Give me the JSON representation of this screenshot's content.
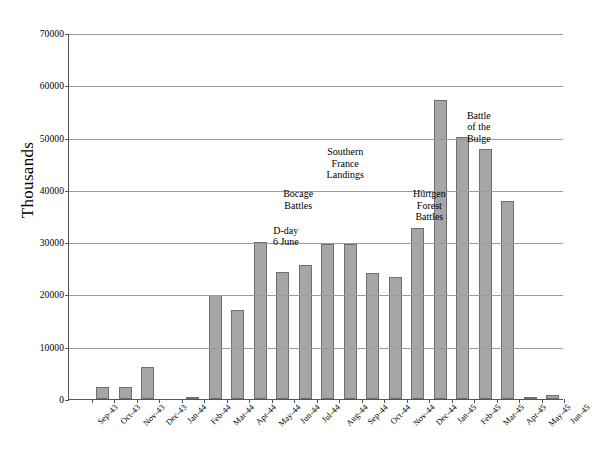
{
  "chart_data": {
    "type": "bar",
    "title": "",
    "xlabel": "",
    "ylabel": "Thousands",
    "ylim": [
      0,
      70000
    ],
    "ytick_step": 10000,
    "yticks": [
      "70000",
      "60000",
      "50000",
      "40000",
      "30000",
      "20000",
      "10000",
      "0"
    ],
    "grid": true,
    "legend": "none",
    "bar_color": "#a6a6a6",
    "bar_border_color": "#6f6f6f",
    "categories": [
      "Sep-43",
      "Oct-43",
      "Nov-43",
      "Dec-43",
      "Jan-44",
      "Feb-44",
      "Mar-44",
      "Apr-44",
      "May-44",
      "Jun-44",
      "Jul-44",
      "Aug-44",
      "Sep-44",
      "Oct-44",
      "Nov-44",
      "Dec-44",
      "Jan-45",
      "Feb-45",
      "Mar-45",
      "Apr-45",
      "May-45",
      "Jun-45"
    ],
    "values": [
      0,
      2300,
      2300,
      6200,
      0,
      300,
      19800,
      17000,
      30100,
      24300,
      25700,
      29700,
      29700,
      24100,
      23400,
      32700,
      57200,
      50200,
      47900,
      37800,
      400,
      700
    ],
    "annotations": [
      {
        "id": "d-day",
        "text": "D-day\n6 June",
        "x_pct": 44.0,
        "value": 33500
      },
      {
        "id": "bocage-battles",
        "text": "Bocage\nBattles",
        "x_pct": 46.5,
        "value": 40500
      },
      {
        "id": "southern-france",
        "text": "Southern\nFrance\nLandings",
        "x_pct": 56.0,
        "value": 48500
      },
      {
        "id": "hurtgen-forest",
        "text": "Hürtgen\nForest\nBattles",
        "x_pct": 73.0,
        "value": 40500
      },
      {
        "id": "battle-of-bulge",
        "text": "Battle\nof the\nBulge",
        "x_pct": 83.0,
        "value": 55500
      }
    ]
  }
}
